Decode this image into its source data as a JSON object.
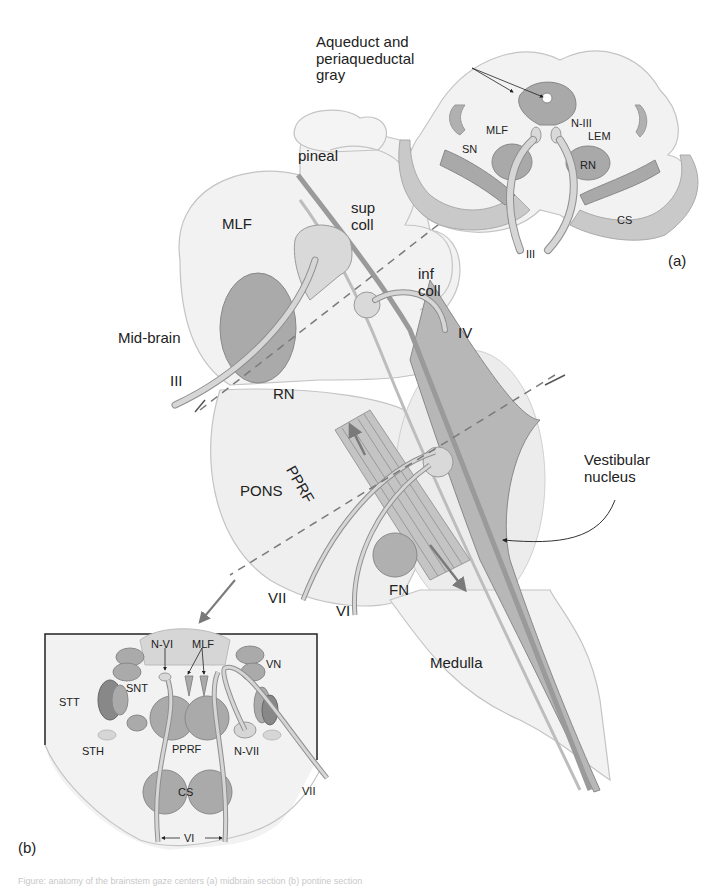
{
  "figure": {
    "colors": {
      "background": "#ffffff",
      "tissue_light": "#f1f1f1",
      "tissue_outline": "#c4c4c4",
      "nucleus_mid": "#a9a9a9",
      "nucleus_light": "#cfcfcf",
      "nerve_fill": "#d6d6d6",
      "nerve_outline": "#8f8f8f",
      "arrow": "#7a7a7a",
      "text": "#222222"
    }
  },
  "main_view": {
    "labels": {
      "pineal": "pineal",
      "sup_coll_1": "sup",
      "sup_coll_2": "coll",
      "inf_coll_1": "inf",
      "inf_coll_2": "coll",
      "mlf": "MLF",
      "midbrain": "Mid-brain",
      "cn3": "III",
      "cn4": "IV",
      "rn": "RN",
      "pprf": "PPRF",
      "pons": "PONS",
      "vestibular_1": "Vestibular",
      "vestibular_2": "nucleus",
      "cn7": "VII",
      "cn6": "VI",
      "fn": "FN",
      "medulla": "Medulla"
    }
  },
  "inset_a": {
    "panel_label": "(a)",
    "callout_1": "Aqueduct and",
    "callout_2": "periaqueductal",
    "callout_3": "gray",
    "labels": {
      "mlf": "MLF",
      "n3": "N-III",
      "lem": "LEM",
      "sn": "SN",
      "rn": "RN",
      "cs": "CS",
      "cn3": "III"
    }
  },
  "inset_b": {
    "panel_label": "(b)",
    "labels": {
      "n6": "N-VI",
      "mlf": "MLF",
      "vn": "VN",
      "stt": "STT",
      "snt": "SNT",
      "sth": "STH",
      "pprf": "PPRF",
      "n7": "N-VII",
      "cs": "CS",
      "cn7": "VII",
      "cn6": "VI"
    }
  },
  "caption": "Figure: anatomy of the brainstem gaze centers (a) midbrain section (b) pontine section"
}
